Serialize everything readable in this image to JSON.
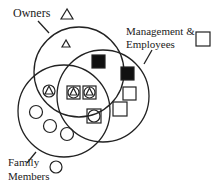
{
  "diagram": {
    "type": "venn",
    "sets": [
      {
        "name": "Owners",
        "symbol": "triangle"
      },
      {
        "name": "Management & Employees",
        "symbol": "square"
      },
      {
        "name": "Family Members",
        "symbol": "circle"
      }
    ],
    "labels": {
      "owners": "Owners",
      "management_line1": "Management &",
      "management_line2": "Employees",
      "family_line1": "Family",
      "family_line2": "Members"
    },
    "regions": [
      {
        "region": "Owners only",
        "members": [
          "triangle"
        ]
      },
      {
        "region": "Owners ∩ Management",
        "members": [
          "filled-square"
        ]
      },
      {
        "region": "Management only",
        "members": [
          "filled-square",
          "square",
          "square"
        ]
      },
      {
        "region": "Owners ∩ Family",
        "members": [
          "circle-with-triangle"
        ]
      },
      {
        "region": "Owners ∩ Management ∩ Family",
        "members": [
          "square-circle-triangle",
          "square-circle-triangle"
        ]
      },
      {
        "region": "Management ∩ Family",
        "members": [
          "square-with-circle"
        ]
      },
      {
        "region": "Family only",
        "members": [
          "circle",
          "circle",
          "circle"
        ]
      }
    ],
    "colors": {
      "stroke": "#222222",
      "fill": "#111111",
      "background": "#ffffff"
    }
  }
}
